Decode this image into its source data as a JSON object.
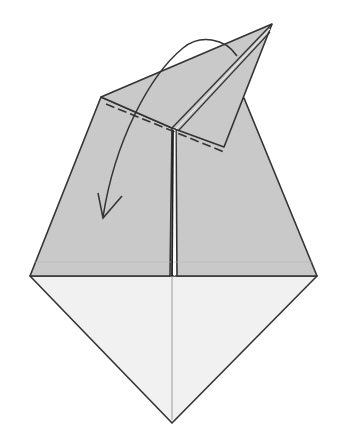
{
  "diagram": {
    "type": "origami-step",
    "colors": {
      "colored_side": "#c9c9c9",
      "white_side": "#f1f1f1",
      "outline": "#333333",
      "background": "#ffffff"
    },
    "elements": {
      "upper_body": "gray colored side of paper (trapezoid)",
      "lower_diamond": "white side triangle",
      "raised_flap": "pointed flap folded up to the right",
      "valley_fold_line": "dashed line along the flap base",
      "center_crease": "vertical center crease",
      "fold_arrow": "curved arrow pointing down-left"
    }
  }
}
